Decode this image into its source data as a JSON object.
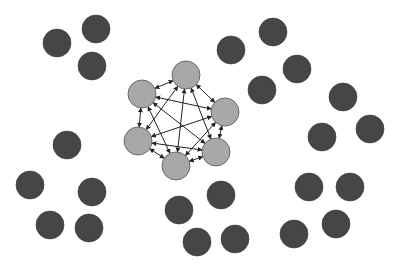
{
  "diagram": {
    "type": "network",
    "colors": {
      "background": "#ffffff",
      "cluster_fill": "#a8a8a8",
      "cluster_stroke": "#555555",
      "outer_fill": "#464646",
      "edge": "#222222"
    },
    "node_radius": 14,
    "cluster_nodes": [
      {
        "id": "c1",
        "x": 186,
        "y": 75
      },
      {
        "id": "c2",
        "x": 225,
        "y": 112
      },
      {
        "id": "c3",
        "x": 216,
        "y": 152
      },
      {
        "id": "c4",
        "x": 176,
        "y": 166
      },
      {
        "id": "c5",
        "x": 138,
        "y": 141
      },
      {
        "id": "c6",
        "x": 142,
        "y": 94
      }
    ],
    "outer_nodes": [
      {
        "x": 57,
        "y": 43
      },
      {
        "x": 96,
        "y": 29
      },
      {
        "x": 92,
        "y": 66
      },
      {
        "x": 231,
        "y": 50
      },
      {
        "x": 273,
        "y": 32
      },
      {
        "x": 297,
        "y": 69
      },
      {
        "x": 262,
        "y": 90
      },
      {
        "x": 343,
        "y": 97
      },
      {
        "x": 322,
        "y": 137
      },
      {
        "x": 370,
        "y": 129
      },
      {
        "x": 67,
        "y": 145
      },
      {
        "x": 30,
        "y": 185
      },
      {
        "x": 92,
        "y": 192
      },
      {
        "x": 50,
        "y": 225
      },
      {
        "x": 89,
        "y": 228
      },
      {
        "x": 179,
        "y": 210
      },
      {
        "x": 221,
        "y": 195
      },
      {
        "x": 197,
        "y": 242
      },
      {
        "x": 235,
        "y": 239
      },
      {
        "x": 309,
        "y": 187
      },
      {
        "x": 350,
        "y": 187
      },
      {
        "x": 336,
        "y": 224
      },
      {
        "x": 294,
        "y": 234
      }
    ],
    "edges": "complete-bidirectional"
  }
}
